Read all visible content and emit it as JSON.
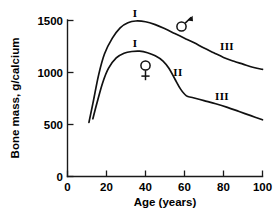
{
  "chart_data": {
    "type": "line",
    "title": "",
    "xlabel": "Age (years)",
    "ylabel": "Bone mass, g/calcium",
    "xlim": [
      0,
      100
    ],
    "ylim": [
      0,
      1500
    ],
    "xticks": [
      "0",
      "20",
      "40",
      "60",
      "80",
      "100"
    ],
    "xtick_values": [
      0,
      20,
      40,
      60,
      80,
      100
    ],
    "yticks": [
      "0",
      "500",
      "1000",
      "1500"
    ],
    "ytick_values": [
      0,
      500,
      1000,
      1500
    ],
    "grid": false,
    "legend": "none",
    "series": [
      {
        "name": "male",
        "symbol": "♂",
        "points": [
          [
            11,
            520
          ],
          [
            13,
            700
          ],
          [
            16,
            980
          ],
          [
            19,
            1180
          ],
          [
            23,
            1330
          ],
          [
            27,
            1430
          ],
          [
            31,
            1478
          ],
          [
            35,
            1495
          ],
          [
            40,
            1488
          ],
          [
            45,
            1460
          ],
          [
            50,
            1420
          ],
          [
            55,
            1375
          ],
          [
            60,
            1330
          ],
          [
            65,
            1285
          ],
          [
            70,
            1235
          ],
          [
            75,
            1190
          ],
          [
            80,
            1145
          ],
          [
            85,
            1110
          ],
          [
            90,
            1080
          ],
          [
            95,
            1050
          ],
          [
            100,
            1030
          ]
        ]
      },
      {
        "name": "female",
        "symbol": "♀",
        "points": [
          [
            13,
            555
          ],
          [
            15,
            700
          ],
          [
            18,
            900
          ],
          [
            21,
            1040
          ],
          [
            25,
            1140
          ],
          [
            29,
            1185
          ],
          [
            33,
            1202
          ],
          [
            37,
            1205
          ],
          [
            41,
            1190
          ],
          [
            45,
            1160
          ],
          [
            49,
            1110
          ],
          [
            52,
            1040
          ],
          [
            55,
            940
          ],
          [
            58,
            840
          ],
          [
            61,
            775
          ],
          [
            64,
            760
          ],
          [
            70,
            730
          ],
          [
            76,
            700
          ],
          [
            82,
            665
          ],
          [
            88,
            625
          ],
          [
            94,
            585
          ],
          [
            100,
            545
          ]
        ]
      }
    ],
    "annotations": [
      {
        "text": "I",
        "x": 35,
        "y": 1570,
        "series": "male",
        "phase": "peak bone mass accrual"
      },
      {
        "text": "III",
        "x": 82,
        "y": 1250,
        "series": "male",
        "phase": "slow age-related loss"
      },
      {
        "text": "I",
        "x": 35,
        "y": 1290,
        "series": "female",
        "phase": "peak bone mass accrual"
      },
      {
        "text": "II",
        "x": 57,
        "y": 1040,
        "series": "female",
        "phase": "rapid postmenopausal loss"
      },
      {
        "text": "III",
        "x": 80,
        "y": 810,
        "series": "female",
        "phase": "slow age-related loss"
      }
    ],
    "symbol_markers": [
      {
        "symbol": "♂",
        "name": "male-symbol",
        "x": 72,
        "y": 1440
      },
      {
        "symbol": "♀",
        "name": "female-symbol",
        "x": 44,
        "y": 1065
      }
    ]
  }
}
